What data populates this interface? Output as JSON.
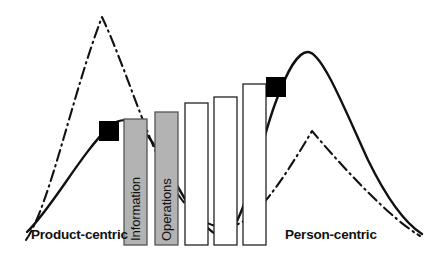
{
  "figure": {
    "title": "",
    "axis_labels": {
      "left": "Product-centric",
      "right": "Person-centric"
    },
    "bars": [
      {
        "label": "Information",
        "fill": "#b3b3b3",
        "stroke": "#555555",
        "x": 124,
        "top": 119,
        "width": 23,
        "filled": true
      },
      {
        "label": "Operations",
        "fill": "#b3b3b3",
        "stroke": "#555555",
        "x": 155,
        "top": 112,
        "width": 23,
        "filled": true
      },
      {
        "label": "",
        "fill": "#ffffff",
        "stroke": "#222222",
        "x": 185,
        "top": 103,
        "width": 23,
        "filled": false
      },
      {
        "label": "",
        "fill": "#ffffff",
        "stroke": "#222222",
        "x": 214,
        "top": 97,
        "width": 23,
        "filled": false
      },
      {
        "label": "",
        "fill": "#ffffff",
        "stroke": "#222222",
        "x": 243,
        "top": 84,
        "width": 23,
        "filled": false
      }
    ],
    "baseline_y": 245,
    "markers": [
      {
        "name": "marker-left",
        "x": 99,
        "y": 121,
        "size": 20,
        "color": "#000000"
      },
      {
        "name": "marker-right",
        "x": 266,
        "y": 77,
        "size": 20,
        "color": "#000000"
      }
    ],
    "curves": [
      {
        "name": "dash-dot-curve",
        "style": "dash-dot",
        "color": "#111111",
        "peaks": [
          {
            "x": 102,
            "y": 17
          },
          {
            "x": 312,
            "y": 131
          }
        ]
      },
      {
        "name": "solid-curve",
        "style": "solid",
        "color": "#111111",
        "peaks": [
          {
            "x": 110,
            "y": 126
          },
          {
            "x": 308,
            "y": 52
          }
        ]
      }
    ],
    "colors": {
      "bar_gray": "#b3b3b3",
      "bar_white": "#ffffff",
      "line": "#111111",
      "marker": "#000000",
      "background": "#ffffff"
    }
  }
}
